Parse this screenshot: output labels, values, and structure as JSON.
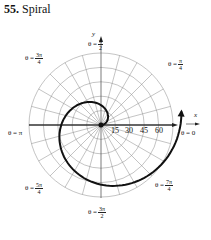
{
  "title": {
    "number": "55.",
    "text": "Spiral"
  },
  "axes": {
    "x": "x",
    "y": "y"
  },
  "angle_labels": [
    {
      "id": "pi-2",
      "prefix": "θ =",
      "num": "π",
      "den": "2"
    },
    {
      "id": "pi-4",
      "prefix": "θ =",
      "num": "π",
      "den": "4"
    },
    {
      "id": "3pi-4",
      "prefix": "θ =",
      "num": "3π",
      "den": "4"
    },
    {
      "id": "pi",
      "text": "θ = π"
    },
    {
      "id": "zero",
      "text": "θ = 0"
    },
    {
      "id": "5pi-4",
      "prefix": "θ =",
      "num": "5π",
      "den": "4"
    },
    {
      "id": "7pi-4",
      "prefix": "θ =",
      "num": "7π",
      "den": "4"
    },
    {
      "id": "3pi-2",
      "prefix": "θ =",
      "num": "3π",
      "den": "2"
    }
  ],
  "radial_ticks": [
    "15",
    "30",
    "45",
    "60"
  ],
  "colors": {
    "grid": "#777777",
    "curve": "#111111"
  }
}
